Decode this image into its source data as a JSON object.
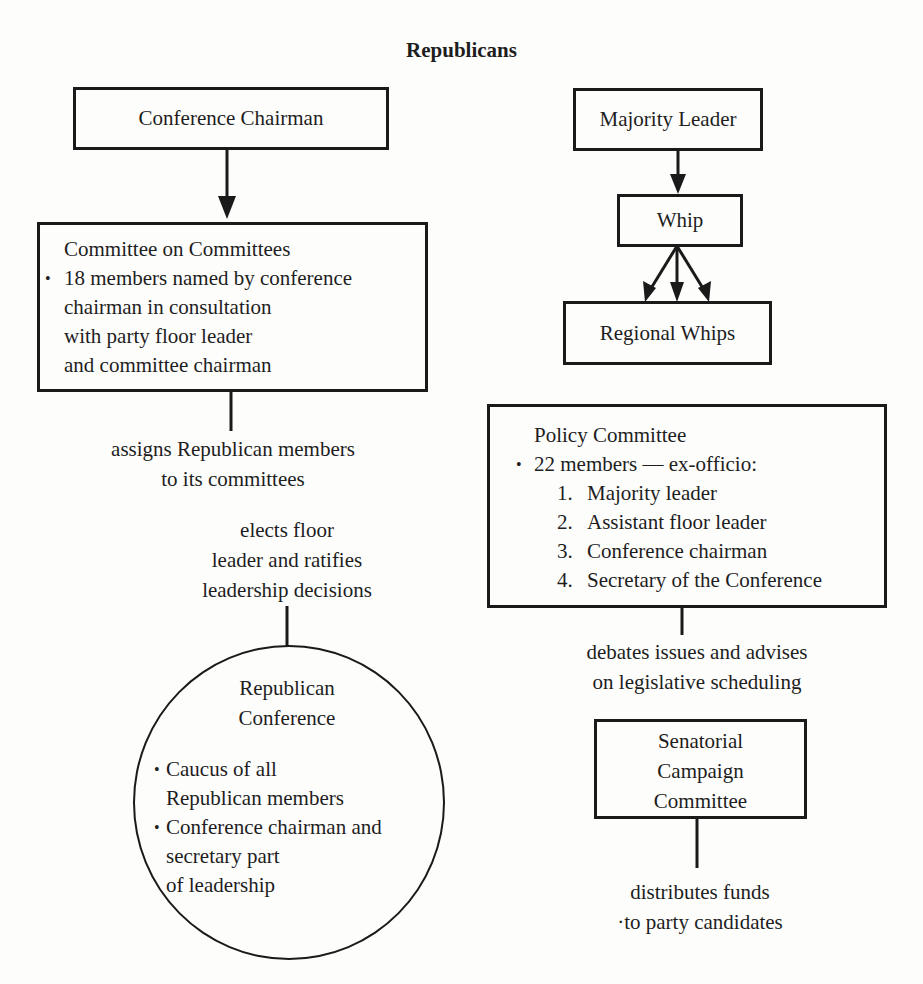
{
  "title": "Republicans",
  "left": {
    "conference_chairman": {
      "label": "Conference Chairman"
    },
    "committee_on_committees": {
      "title": "Committee on Committees",
      "bullet_lines": [
        "18 members named by conference",
        "chairman in consultation",
        "with party floor leader",
        "and committee chairman"
      ]
    },
    "assigns_note": {
      "lines": [
        "assigns Republican members",
        "to its committees"
      ]
    },
    "elects_note": {
      "lines": [
        "elects floor",
        "leader and ratifies",
        "leadership decisions"
      ]
    },
    "republican_conference": {
      "title_lines": [
        "Republican",
        "Conference"
      ],
      "bullets": [
        {
          "lines": [
            "Caucus of all",
            "Republican members"
          ]
        },
        {
          "lines": [
            "Conference chairman and",
            "secretary part",
            "of leadership"
          ]
        }
      ]
    }
  },
  "right": {
    "majority_leader": {
      "label": "Majority Leader"
    },
    "whip": {
      "label": "Whip"
    },
    "regional_whips": {
      "label": "Regional Whips"
    },
    "policy_committee": {
      "title": "Policy Committee",
      "bullet": "22 members — ex-officio:",
      "items": [
        {
          "num": "1.",
          "label": "Majority leader"
        },
        {
          "num": "2.",
          "label": "Assistant floor leader"
        },
        {
          "num": "3.",
          "label": "Conference chairman"
        },
        {
          "num": "4.",
          "label": "Secretary of the Conference"
        }
      ]
    },
    "debates_note": {
      "lines": [
        "debates issues and advises",
        "on legislative scheduling"
      ]
    },
    "senatorial_campaign_committee": {
      "lines": [
        "Senatorial",
        "Campaign",
        "Committee"
      ]
    },
    "distributes_note": {
      "lines": [
        "distributes funds",
        "·to party candidates"
      ]
    }
  },
  "colors": {
    "line": "#1a1a1a",
    "text": "#1e1e1e",
    "background": "#fdfdfc"
  }
}
